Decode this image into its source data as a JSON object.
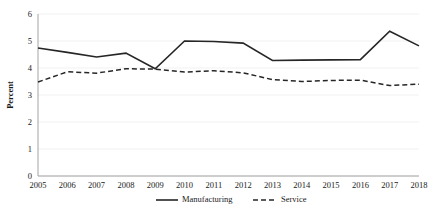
{
  "chart_data": {
    "type": "line",
    "title": "",
    "xlabel": "",
    "ylabel": "Percent",
    "ylim": [
      0,
      6
    ],
    "ytick_step": 1,
    "yticks": [
      "0",
      "1",
      "2",
      "3",
      "4",
      "5",
      "6"
    ],
    "grid": true,
    "grid_axis": "y",
    "legend_position": "bottom",
    "categories": [
      "2005",
      "2006",
      "2007",
      "2008",
      "2009",
      "2010",
      "2011",
      "2012",
      "2013",
      "2014",
      "2015",
      "2016",
      "2017",
      "2018"
    ],
    "series": [
      {
        "name": "Manufacturing",
        "style": "solid",
        "color": "#262626",
        "values": [
          4.74,
          4.58,
          4.41,
          4.55,
          3.97,
          5.0,
          4.98,
          4.92,
          4.28,
          4.29,
          4.3,
          4.31,
          5.36,
          4.82
        ]
      },
      {
        "name": "Service",
        "style": "dashed",
        "color": "#262626",
        "values": [
          3.48,
          3.86,
          3.81,
          3.97,
          3.96,
          3.85,
          3.9,
          3.82,
          3.57,
          3.5,
          3.54,
          3.55,
          3.35,
          3.4
        ]
      }
    ]
  },
  "legend": {
    "items": [
      {
        "label": "Manufacturing",
        "style": "solid"
      },
      {
        "label": "Service",
        "style": "dashed"
      }
    ]
  },
  "axes": {
    "y_axis_title": "Percent"
  },
  "colors": {
    "line": "#262626",
    "axis": "#9a9a9a",
    "grid": "#ededed",
    "text": "#1a1a1a",
    "background": "#ffffff"
  }
}
